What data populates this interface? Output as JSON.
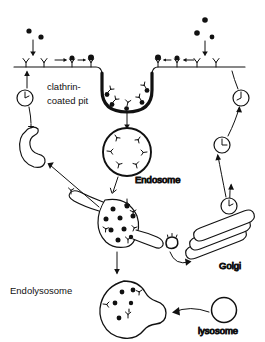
{
  "diagram": {
    "background_color": "#ffffff",
    "stroke_color": "#111111",
    "labels": {
      "clathrin_line1": "clathrin-",
      "clathrin_line2": "coated pit",
      "endosome": "Endosome",
      "endolysosome": "Endolysosome",
      "golgi": "Golgi",
      "lysosome": "lysosome"
    },
    "structures": {
      "plasma_membrane": "plasma-membrane",
      "clathrin_coated_pit": "clathrin-coated-pit",
      "endosome": "endosome",
      "sorting_endosome": "sorting-endosome",
      "endolysosome": "endolysosome",
      "lysosome": "lysosome",
      "golgi_stack": "golgi-stack",
      "recycling_tubule": "recycling-tubule"
    },
    "ligands": {
      "name": "ligand-particle",
      "left_free": [
        {
          "x": 29,
          "y": 31
        },
        {
          "x": 41,
          "y": 37
        }
      ],
      "right_free": [
        {
          "x": 205,
          "y": 20
        },
        {
          "x": 198,
          "y": 33
        },
        {
          "x": 212,
          "y": 37
        }
      ]
    },
    "receptors": {
      "name": "membrane-receptor",
      "left_unbound": [
        {
          "x": 26,
          "y": 63
        },
        {
          "x": 44,
          "y": 63
        }
      ],
      "right_unbound": [
        {
          "x": 197,
          "y": 63
        },
        {
          "x": 216,
          "y": 63
        }
      ],
      "left_bound": [
        {
          "x": 72,
          "y": 63
        },
        {
          "x": 91,
          "y": 63
        }
      ],
      "right_bound": [
        {
          "x": 158,
          "y": 63
        },
        {
          "x": 177,
          "y": 63
        }
      ]
    },
    "endosome_cargo": {
      "name": "internalized-receptor",
      "count": 6
    },
    "sorting_endosome_cargo": {
      "free_ligands": 9,
      "receptors": 5
    },
    "endolysosome_cargo": {
      "free_ligands": 5,
      "receptors": 3
    },
    "recycling_vesicles": {
      "name": "recycling-vesicle",
      "left": [
        {
          "x": 25,
          "y": 98,
          "r": 8
        }
      ],
      "right": [
        {
          "x": 241,
          "y": 98,
          "r": 8
        },
        {
          "x": 222,
          "y": 145,
          "r": 8
        },
        {
          "x": 229,
          "y": 206,
          "r": 8
        }
      ]
    },
    "arrows": {
      "uptake_left": "ligand-uptake-arrow-left",
      "uptake_right": "ligand-uptake-arrow-right",
      "internalization": "internalization-arrow",
      "endosome_to_sorting": "endosome-to-sorting-arrow",
      "sorting_to_endolysosome": "sorting-to-endolysosome-arrow",
      "lysosome_fusion": "lysosome-fusion-arrow",
      "golgi_traffic": "golgi-traffic-arrow",
      "recycling_path": "recycling-path-arrow"
    }
  }
}
